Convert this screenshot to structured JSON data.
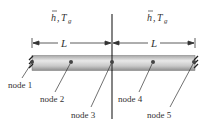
{
  "diagram": {
    "boundary_labels": {
      "left": {
        "h": "h",
        "sep": ",",
        "T": "T",
        "sub": "g"
      },
      "right": {
        "h": "h",
        "sep": ",",
        "T": "T",
        "sub": "g"
      }
    },
    "dimensions": [
      {
        "label": "L"
      },
      {
        "label": "L"
      }
    ],
    "nodes": [
      {
        "label": "node 1"
      },
      {
        "label": "node 2"
      },
      {
        "label": "node 3"
      },
      {
        "label": "node 4"
      },
      {
        "label": "node 5"
      }
    ],
    "colors": {
      "rod_light": "#e6e6e6",
      "rod_dark": "#9a9a9a",
      "line": "#333333",
      "node": "#555555"
    }
  }
}
